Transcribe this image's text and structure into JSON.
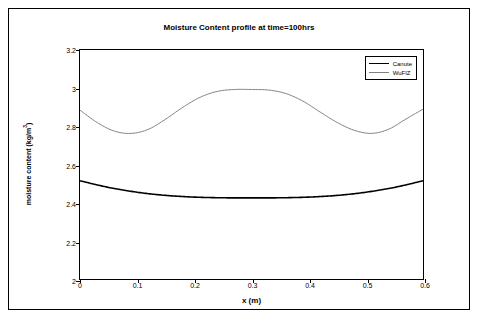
{
  "chart_data": {
    "type": "line",
    "title": "Moisture Content profile at time=100hrs",
    "xlabel": "x (m)",
    "ylabel": "moisture content (kg/m3)",
    "ylabel_base": "moisture content (kg/m",
    "ylabel_sup": "3",
    "ylabel_tail": ")",
    "xlim": [
      0,
      0.6
    ],
    "ylim": [
      2,
      3.2
    ],
    "xticks": [
      0,
      0.1,
      0.2,
      0.3,
      0.4,
      0.5,
      0.6
    ],
    "xticklabels": [
      "0",
      "0.1",
      "0.2",
      "0.3",
      "0.4",
      "0.5",
      "0.6"
    ],
    "yticks": [
      2,
      2.2,
      2.4,
      2.6,
      2.8,
      3,
      3.2
    ],
    "yticklabels": [
      "2",
      "2.2",
      "2.4",
      "2.6",
      "2.8",
      "3",
      "3.2"
    ],
    "grid": false,
    "legend_position": "top-right",
    "series": [
      {
        "name": "Canute",
        "color": "#000000",
        "width": 1.6,
        "x": [
          0,
          0.03,
          0.06,
          0.09,
          0.12,
          0.15,
          0.18,
          0.21,
          0.24,
          0.27,
          0.3,
          0.33,
          0.36,
          0.39,
          0.42,
          0.45,
          0.48,
          0.51,
          0.54,
          0.57,
          0.6
        ],
        "y": [
          2.515,
          2.493,
          2.474,
          2.459,
          2.447,
          2.438,
          2.432,
          2.428,
          2.426,
          2.425,
          2.425,
          2.425,
          2.426,
          2.428,
          2.432,
          2.438,
          2.447,
          2.459,
          2.474,
          2.493,
          2.515
        ]
      },
      {
        "name": "WuFIZ",
        "color": "#808080",
        "width": 1.0,
        "x": [
          0,
          0.03,
          0.06,
          0.09,
          0.12,
          0.15,
          0.18,
          0.21,
          0.24,
          0.27,
          0.3,
          0.33,
          0.36,
          0.39,
          0.42,
          0.45,
          0.48,
          0.51,
          0.54,
          0.57,
          0.6
        ],
        "y": [
          2.885,
          2.82,
          2.775,
          2.763,
          2.785,
          2.838,
          2.9,
          2.952,
          2.983,
          2.993,
          2.993,
          2.99,
          2.972,
          2.932,
          2.875,
          2.82,
          2.779,
          2.763,
          2.785,
          2.838,
          2.89
        ]
      }
    ]
  },
  "legend": {
    "entries": [
      "Canute",
      "WuFIZ"
    ]
  }
}
